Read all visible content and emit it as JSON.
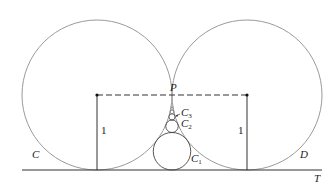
{
  "diagram": {
    "labels": {
      "circle_left": "C",
      "circle_right": "D",
      "tangent_line": "T",
      "point_p": "P",
      "radius_left": "1",
      "radius_right": "1",
      "c1": "C",
      "c1_sub": "1",
      "c2": "C",
      "c2_sub": "2",
      "c3": "C",
      "c3_sub": "3"
    },
    "colors": {
      "circle_stroke": "#9a9a9a",
      "line_stroke": "#333333"
    }
  }
}
